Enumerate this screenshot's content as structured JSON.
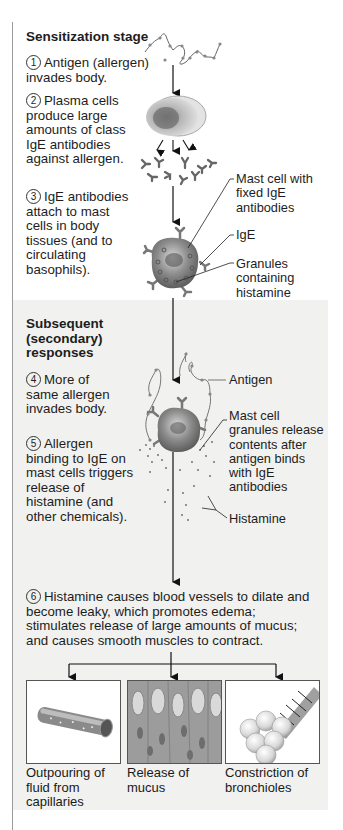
{
  "sensitization": {
    "title": "Sensitization stage",
    "steps": [
      {
        "num": "1",
        "text": "Antigen (allergen) invades body."
      },
      {
        "num": "2",
        "text": "Plasma cells produce large amounts of class IgE antibodies against allergen."
      },
      {
        "num": "3",
        "text": "IgE antibodies attach to mast cells in body tissues (and to circulating basophils)."
      }
    ],
    "labels": {
      "mast_cell": "Mast cell with fixed IgE antibodies",
      "ige": "IgE",
      "granules": "Granules containing histamine"
    }
  },
  "secondary": {
    "title": "Subsequent (secondary) responses",
    "steps": [
      {
        "num": "4",
        "text": "More of same allergen invades body."
      },
      {
        "num": "5",
        "text": "Allergen binding to IgE on mast cells triggers release of histamine (and other chemicals)."
      },
      {
        "num": "6",
        "text": "Histamine causes blood vessels to dilate and become leaky, which promotes edema; stimulates release of large amounts of mucus; and causes smooth muscles to contract."
      }
    ],
    "labels": {
      "antigen": "Antigen",
      "granules_release": "Mast cell granules release contents after antigen binds with IgE antibodies",
      "histamine": "Histamine"
    }
  },
  "outcomes": [
    {
      "caption": "Outpouring of fluid from capillaries",
      "icon": "capillary-icon"
    },
    {
      "caption": "Release of mucus",
      "icon": "mucus-cells-icon"
    },
    {
      "caption": "Constriction of bronchioles",
      "icon": "bronchiole-icon"
    }
  ],
  "colors": {
    "text": "#1d1d1d",
    "secondary_bg": "#f1f1ef",
    "cell_gray": "#8a8a8a",
    "rule": "#9a9a9a"
  }
}
